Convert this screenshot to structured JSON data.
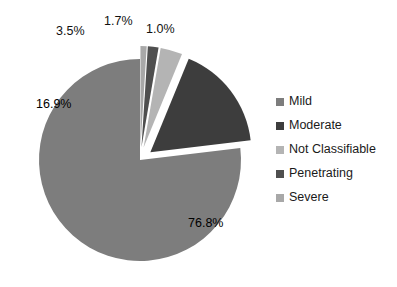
{
  "chart_data": {
    "type": "pie",
    "title": "",
    "categories": [
      "Mild",
      "Moderate",
      "Not Classifiable",
      "Penetrating",
      "Severe"
    ],
    "values": [
      76.8,
      16.9,
      3.5,
      1.7,
      1.0
    ],
    "value_labels": [
      "76.8%",
      "16.9%",
      "3.5%",
      "1.7%",
      "1.0%"
    ],
    "colors": [
      "#7d7d7d",
      "#3d3d3d",
      "#b4b4b4",
      "#4f4f4f",
      "#a8a8a8"
    ],
    "exploded": [
      false,
      true,
      true,
      true,
      true
    ],
    "legend_position": "right",
    "grid": false,
    "units": "percent"
  },
  "legend": {
    "items": [
      {
        "label": "Mild",
        "color": "#7d7d7d"
      },
      {
        "label": "Moderate",
        "color": "#3d3d3d"
      },
      {
        "label": "Not Classifiable",
        "color": "#b4b4b4"
      },
      {
        "label": "Penetrating",
        "color": "#4f4f4f"
      },
      {
        "label": "Severe",
        "color": "#a8a8a8"
      }
    ]
  },
  "labels": {
    "mild": "76.8%",
    "moderate": "16.9%",
    "not_classifiable": "3.5%",
    "penetrating": "1.7%",
    "severe": "1.0%"
  }
}
